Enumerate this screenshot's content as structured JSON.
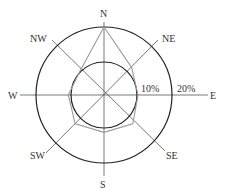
{
  "chart_data": {
    "type": "radar",
    "title": "",
    "categories": [
      "N",
      "NE",
      "E",
      "SE",
      "S",
      "SW",
      "W",
      "NW"
    ],
    "series": [
      {
        "name": "wind frequency",
        "values": [
          20,
          11.5,
          10,
          12,
          11,
          12,
          10.5,
          10
        ]
      }
    ],
    "unit": "%",
    "rings": [
      {
        "value": 10,
        "label": "10%"
      },
      {
        "value": 20,
        "label": "20%"
      }
    ],
    "rlim": [
      0,
      20
    ],
    "grid": true,
    "legend": "none"
  },
  "labels": {
    "N": "N",
    "NE": "NE",
    "E": "E",
    "SE": "SE",
    "S": "S",
    "SW": "SW",
    "W": "W",
    "NW": "NW",
    "ring_inner": "10%",
    "ring_outer": "20%"
  },
  "colors": {
    "ring": "#222222",
    "axis": "#555555",
    "polygon": "#9a9a9a",
    "text": "#333333"
  }
}
